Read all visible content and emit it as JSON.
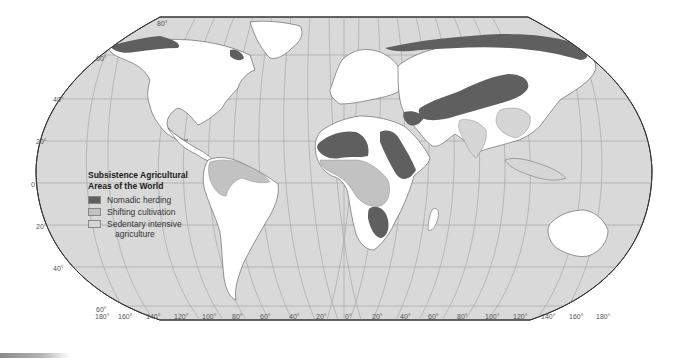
{
  "map": {
    "title": "Subsistence Agricultural Areas of the World",
    "title_line1": "Subsistence Agricultural",
    "title_line2": "Areas of the World",
    "projection": "Robinson",
    "colors": {
      "ocean": "#d9d9d9",
      "land_other": "#ffffff",
      "nomadic_herding": "#5f5f5f",
      "shifting_cultivation": "#c4c4c4",
      "sedentary_intensive": "#cfcfcf",
      "graticule": "#a8a8a8",
      "border": "#333333"
    }
  },
  "legend": {
    "title_line1": "Subsistence Agricultural",
    "title_line2": "Areas of the World",
    "items": [
      {
        "label": "Nomadic herding",
        "color": "#5f5f5f"
      },
      {
        "label": "Shifting cultivation",
        "color": "#c2c2c2"
      },
      {
        "label": "Sedentary intensive",
        "label_line2": "agriculture",
        "color": "#d6d6d6"
      }
    ]
  },
  "latitude_labels": {
    "n80": "80°",
    "n60": "60°",
    "n40": "40°",
    "n20": "20°",
    "eq": "0°",
    "s20": "20°",
    "s40": "40°",
    "s60": "60°"
  },
  "longitude_labels": [
    "180°",
    "160°",
    "140°",
    "120°",
    "100°",
    "80°",
    "60°",
    "40°",
    "20°",
    "0°",
    "20°",
    "40°",
    "60°",
    "80°",
    "100°",
    "120°",
    "140°",
    "160°",
    "180°"
  ]
}
